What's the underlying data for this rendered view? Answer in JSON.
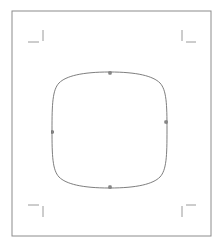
{
  "canvas": {
    "width": 222,
    "height": 246,
    "background_color": "#ffffff",
    "label": "Artboard Canvas"
  },
  "page_border": {
    "name": "page-border",
    "x": 12,
    "y": 11,
    "width": 199,
    "height": 225,
    "stroke_color": "#8c8c8c",
    "stroke_width": 1
  },
  "crop_marks": {
    "stroke_color": "#9a9a9a",
    "stroke_width": 1,
    "items": [
      {
        "name": "crop-mark-top-left",
        "corner": "top-left",
        "horizontal": {
          "x1": 28,
          "y1": 42,
          "x2": 39,
          "y2": 42
        },
        "vertical": {
          "x1": 43,
          "y1": 30,
          "x2": 43,
          "y2": 41
        }
      },
      {
        "name": "crop-mark-top-right",
        "corner": "top-right",
        "horizontal": {
          "x1": 186,
          "y1": 42,
          "x2": 196,
          "y2": 42
        },
        "vertical": {
          "x1": 182,
          "y1": 30,
          "x2": 182,
          "y2": 41
        }
      },
      {
        "name": "crop-mark-bottom-left",
        "corner": "bottom-left",
        "horizontal": {
          "x1": 28,
          "y1": 205,
          "x2": 39,
          "y2": 205
        },
        "vertical": {
          "x1": 43,
          "y1": 206,
          "x2": 43,
          "y2": 217
        }
      },
      {
        "name": "crop-mark-bottom-right",
        "corner": "bottom-right",
        "horizontal": {
          "x1": 186,
          "y1": 205,
          "x2": 196,
          "y2": 205
        },
        "vertical": {
          "x1": 182,
          "y1": 206,
          "x2": 182,
          "y2": 217
        }
      }
    ]
  },
  "shape": {
    "name": "squircle-path",
    "type": "rounded-square-superellipse",
    "stroke_color": "#6f6f6f",
    "stroke_width": 0.9,
    "fill": "none",
    "bounds": {
      "left": 52,
      "top": 72,
      "right": 167,
      "bottom": 188
    },
    "center": {
      "x": 109.5,
      "y": 130
    },
    "path_d": "M 109.5 72 C 137 72 153 76 160 83 C 166.5 90 167 104 167 130 C 167 156 166.5 170 160 177 C 153 184 137 188 109.5 188 C 82 188 66 184 59 177 C 52.5 170 52 156 52 130 C 52 104 52.5 90 59 83 C 66 76 82 72 109.5 72 Z"
  },
  "nodes": {
    "stroke_color": "#5a5a5a",
    "fill_color": "#8a8a8a",
    "size": 2.4,
    "items": [
      {
        "name": "node-handle-top",
        "position": "top",
        "x": 110,
        "y": 73
      },
      {
        "name": "node-handle-right",
        "position": "right",
        "x": 166,
        "y": 122
      },
      {
        "name": "node-handle-bottom",
        "position": "bottom",
        "x": 110,
        "y": 187
      },
      {
        "name": "node-handle-left",
        "position": "left",
        "x": 52.5,
        "y": 132
      }
    ]
  }
}
